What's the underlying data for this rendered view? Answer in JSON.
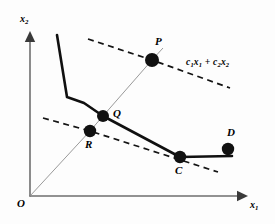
{
  "figure": {
    "background_color": "#fdfdfd",
    "ink_color": "#111111",
    "axes": {
      "x_label": "x",
      "x_label_sub": "1",
      "y_label": "x",
      "y_label_sub": "2",
      "origin_label": "O"
    },
    "objective_label": {
      "c1": "c",
      "c1_sub": "1",
      "x1": "x",
      "x1_sub": "1",
      "plus": "+",
      "c2": "c",
      "c2_sub": "2",
      "x2": "x",
      "x2_sub": "2"
    },
    "points": [
      {
        "name": "P",
        "label": "P",
        "x": 152,
        "y": 60,
        "label_x": 155,
        "label_y": 36,
        "radius": 7.0
      },
      {
        "name": "Q",
        "label": "Q",
        "x": 103,
        "y": 116,
        "label_x": 113,
        "label_y": 108,
        "radius": 6.0
      },
      {
        "name": "R",
        "label": "R",
        "x": 90,
        "y": 131,
        "label_x": 85,
        "label_y": 139,
        "radius": 6.2
      },
      {
        "name": "C",
        "label": "C",
        "x": 180,
        "y": 157,
        "label_x": 175,
        "label_y": 165,
        "radius": 6.2
      },
      {
        "name": "D",
        "label": "D",
        "x": 228,
        "y": 149,
        "label_x": 227,
        "label_y": 127,
        "radius": 6.2
      }
    ]
  },
  "chart_data": {
    "type": "line",
    "xlabel": "x1",
    "ylabel": "x2",
    "xlim": [
      0,
      275
    ],
    "ylim": [
      0,
      224
    ],
    "grid": false,
    "legend": null,
    "annotations": [
      {
        "text": "c1x1 + c2x2",
        "x": 205,
        "y": 68
      },
      {
        "text": "O",
        "x": 22,
        "y": 205
      },
      {
        "text": "x1",
        "x": 252,
        "y": 207
      },
      {
        "text": "x2",
        "x": 22,
        "y": 20
      }
    ],
    "series": [
      {
        "name": "feasible-boundary",
        "style": "solid",
        "points": [
          [
            57,
            35
          ],
          [
            67,
            97
          ],
          [
            84,
            103
          ],
          [
            103,
            116
          ],
          [
            180,
            157
          ],
          [
            232,
            156
          ]
        ]
      },
      {
        "name": "iso-cost-upper",
        "style": "dashed",
        "points": [
          [
            88,
            39
          ],
          [
            152,
            60
          ],
          [
            230,
            88
          ]
        ]
      },
      {
        "name": "iso-cost-lower",
        "style": "dashed",
        "points": [
          [
            43,
            118
          ],
          [
            90,
            131
          ],
          [
            218,
            172
          ]
        ]
      },
      {
        "name": "ray-from-origin",
        "style": "thin",
        "points": [
          [
            30,
            196
          ],
          [
            90,
            131
          ],
          [
            103,
            116
          ],
          [
            152,
            60
          ],
          [
            163,
            48
          ]
        ]
      },
      {
        "name": "x-axis",
        "style": "axis",
        "points": [
          [
            30,
            196
          ],
          [
            248,
            196
          ]
        ]
      },
      {
        "name": "y-axis",
        "style": "axis",
        "points": [
          [
            30,
            196
          ],
          [
            30,
            31
          ]
        ]
      }
    ]
  }
}
